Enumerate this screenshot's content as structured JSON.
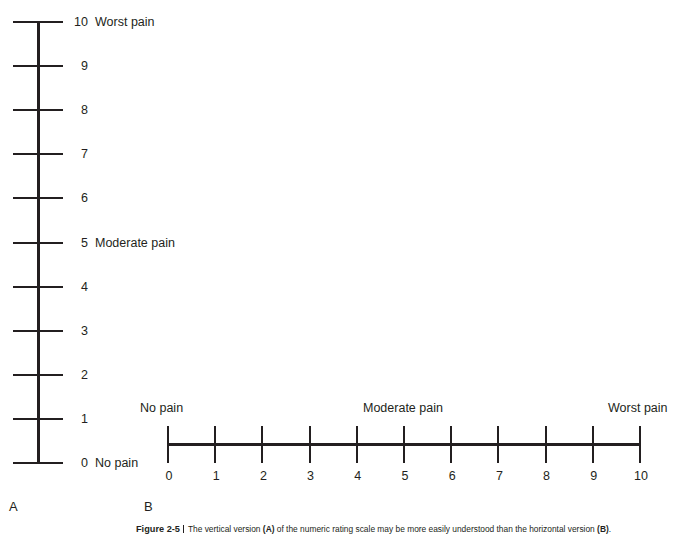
{
  "figure": {
    "caption_number": "Figure 2-5",
    "caption_part1": "The vertical version ",
    "caption_bold_a": "(A)",
    "caption_part2": " of the numeric rating scale may be more easily understood than the horizontal version ",
    "caption_bold_b": "(B)",
    "caption_part3": "."
  },
  "panel_a": {
    "letter": "A",
    "orientation": "vertical",
    "anchors": {
      "top": "Worst pain",
      "middle": "Moderate pain",
      "bottom": "No pain"
    },
    "ticks": [
      {
        "value": "10",
        "anchor": "Worst pain"
      },
      {
        "value": "9",
        "anchor": ""
      },
      {
        "value": "8",
        "anchor": ""
      },
      {
        "value": "7",
        "anchor": ""
      },
      {
        "value": "6",
        "anchor": ""
      },
      {
        "value": "5",
        "anchor": "Moderate pain"
      },
      {
        "value": "4",
        "anchor": ""
      },
      {
        "value": "3",
        "anchor": ""
      },
      {
        "value": "2",
        "anchor": ""
      },
      {
        "value": "1",
        "anchor": ""
      },
      {
        "value": "0",
        "anchor": "No pain"
      }
    ]
  },
  "panel_b": {
    "letter": "B",
    "orientation": "horizontal",
    "anchors": {
      "left": "No pain",
      "center": "Moderate pain",
      "right": "Worst pain"
    },
    "ticks": [
      {
        "value": "0"
      },
      {
        "value": "1"
      },
      {
        "value": "2"
      },
      {
        "value": "3"
      },
      {
        "value": "4"
      },
      {
        "value": "5"
      },
      {
        "value": "6"
      },
      {
        "value": "7"
      },
      {
        "value": "8"
      },
      {
        "value": "9"
      },
      {
        "value": "10"
      }
    ]
  },
  "chart_data": {
    "type": "table",
    "categories": [
      "0",
      "1",
      "2",
      "3",
      "4",
      "5",
      "6",
      "7",
      "8",
      "9",
      "10"
    ],
    "values": [
      0,
      1,
      2,
      3,
      4,
      5,
      6,
      7,
      8,
      9,
      10
    ],
    "xlabel": "",
    "ylabel": "",
    "xlim": [
      0,
      10
    ],
    "ylim": [
      0,
      10
    ],
    "grid": false,
    "legend": "none",
    "annotations": [
      {
        "at": 0,
        "text": "No pain"
      },
      {
        "at": 5,
        "text": "Moderate pain"
      },
      {
        "at": 10,
        "text": "Worst pain"
      }
    ]
  },
  "colors": {
    "ink": "#231f20",
    "background": "#ffffff"
  }
}
